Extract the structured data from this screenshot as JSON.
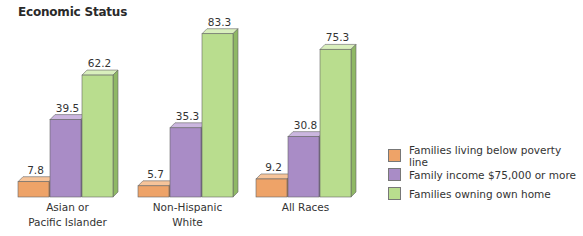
{
  "title": "Economic Status",
  "chart_data": {
    "type": "bar",
    "title": "Economic Status",
    "xlabel": "",
    "ylabel": "",
    "categories": [
      "Asian or Pacific Islander",
      "Non-Hispanic White",
      "All Races"
    ],
    "category_lines": [
      [
        "Asian or",
        "Pacific Islander"
      ],
      [
        "Non-Hispanic",
        "White"
      ],
      [
        "All Races"
      ]
    ],
    "series": [
      {
        "name": "Families living below poverty line",
        "color": "#eea368",
        "side": "#c97a3c",
        "top": "#f6c49a",
        "values": [
          7.8,
          5.7,
          9.2
        ]
      },
      {
        "name": "Family income $75,000 or more",
        "color": "#a98cc6",
        "side": "#7f64a0",
        "top": "#cbb6df",
        "values": [
          39.5,
          35.3,
          30.8
        ]
      },
      {
        "name": "Families owning own home",
        "color": "#b9dd8e",
        "side": "#8fb865",
        "top": "#d9efbd",
        "values": [
          62.2,
          83.3,
          75.3
        ]
      }
    ],
    "ylim": [
      0,
      90
    ],
    "grid": false,
    "legend_position": "right"
  },
  "legend": {
    "items": [
      {
        "label": "Families living below poverty line"
      },
      {
        "label": "Family income $75,000 or more"
      },
      {
        "label": "Families owning own home"
      }
    ]
  }
}
